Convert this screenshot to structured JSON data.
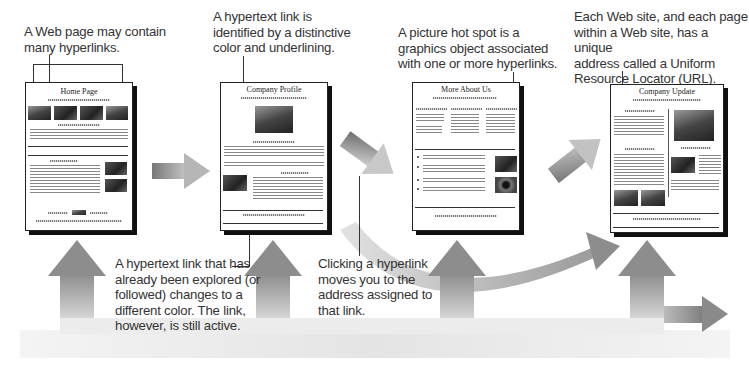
{
  "captions": {
    "web_page_contains": "A Web page may contain\nmany hyperlinks.",
    "hypertext_identified": "A hypertext link is\nidentified by a distinctive\ncolor and underlining.",
    "picture_hot_spot": "A picture hot spot is a\ngraphics object associated\nwith one or more hyperlinks.",
    "url": "Each Web site, and each page\nwithin a Web site, has a unique\naddress called a Uniform\nResource Locator (URL).",
    "followed_link": "A hypertext link that has\nalready been explored (or\nfollowed) changes to a\ndifferent color. The link,\nhowever, is still active.",
    "clicking_hyperlink": "Clicking a hyperlink\nmoves you to the\naddress assigned to\nthat link."
  },
  "pages": [
    {
      "title": "Home Page"
    },
    {
      "title": "Company Profile"
    },
    {
      "title": "More About Us"
    },
    {
      "title": "Company Update"
    }
  ],
  "colors": {
    "arrow_dark": "#7a7a7a",
    "arrow_light": "#e6e6e6",
    "text": "#333333",
    "page_border": "#222222"
  }
}
